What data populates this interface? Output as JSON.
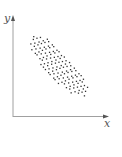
{
  "diagram": {
    "type": "scatter-plot-sketch",
    "axes": {
      "x_label": "x",
      "y_label": "y",
      "color": "#a0a0a0"
    },
    "point_color": "#333333",
    "cloud": {
      "shape": "ellipse",
      "center": [
        58,
        65
      ],
      "rx": 40,
      "ry": 13,
      "rotation_deg": 47
    }
  },
  "chart_data": {
    "type": "scatter",
    "title": "",
    "xlabel": "x",
    "ylabel": "y",
    "grid": false,
    "legend": null,
    "trend": "negative",
    "note": "Points form a tilted elliptical cloud running from upper-left to lower-right; no tick labels or numeric values shown."
  }
}
